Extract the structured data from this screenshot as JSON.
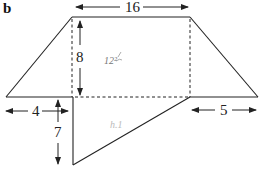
{
  "panel": {
    "label": "b"
  },
  "dimensions": {
    "top_width": "16",
    "height": "8",
    "left_offset": "4",
    "right_offset": "5",
    "triangle_depth": "7"
  },
  "annotations": {
    "handwritten_area": "12²",
    "handwritten_faint": "h.1"
  },
  "colors": {
    "stroke": "#222222",
    "background": "#ffffff",
    "pencil": "#777777"
  }
}
